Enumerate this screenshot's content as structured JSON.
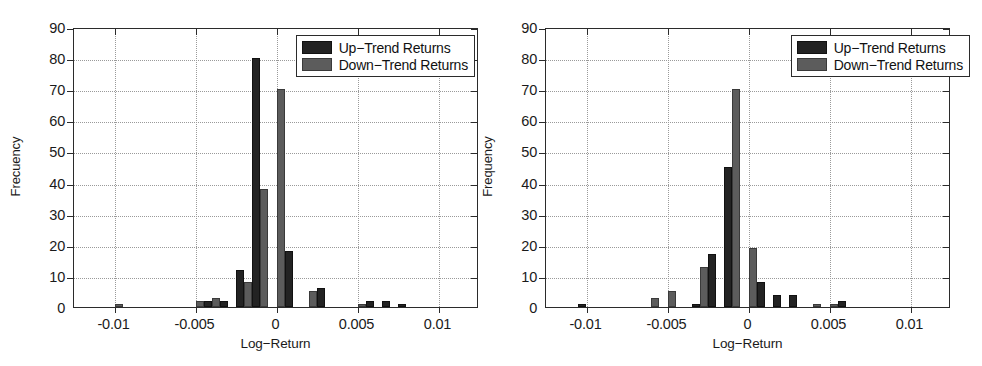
{
  "figure": {
    "panel_count": 2,
    "background": "#ffffff",
    "colors": {
      "up_trend": "#232323",
      "down_trend": "#5c5c5c",
      "axis": "#2b2b2b",
      "grid": "#9a9a9a"
    }
  },
  "chart_data": [
    {
      "type": "bar",
      "title": "",
      "xlabel": "Log−Return",
      "ylabel": "Frecuency",
      "xlim": [
        -0.0125,
        0.0125
      ],
      "ylim": [
        0,
        90
      ],
      "ytick_labels": [
        "0",
        "10",
        "20",
        "30",
        "40",
        "50",
        "60",
        "70",
        "80",
        "90"
      ],
      "ytick_values": [
        0,
        10,
        20,
        30,
        40,
        50,
        60,
        70,
        80,
        90
      ],
      "xtick_labels": [
        "-0.01",
        "-0.005",
        "0",
        "0.005",
        "0.01"
      ],
      "xtick_values": [
        -0.01,
        -0.005,
        0,
        0.005,
        0.01
      ],
      "grid": true,
      "legend_position": "top-right",
      "legend": [
        "Up−Trend Returns",
        "Down−Trend Returns"
      ],
      "bin_centers": [
        -0.01,
        -0.009,
        -0.008,
        -0.007,
        -0.006,
        -0.005,
        -0.004,
        -0.003,
        -0.002,
        -0.001,
        0.0,
        0.001,
        0.002,
        0.003,
        0.004,
        0.005,
        0.006,
        0.007,
        0.008,
        0.009
      ],
      "series": [
        {
          "name": "Up−Trend Returns",
          "color": "#232323",
          "values": [
            0,
            0,
            0,
            0,
            0,
            0,
            2,
            2,
            12,
            80,
            0,
            18,
            0,
            6,
            0,
            0,
            2,
            2,
            1,
            0
          ]
        },
        {
          "name": "Down−Trend Returns",
          "color": "#5c5c5c",
          "values": [
            1,
            0,
            0,
            0,
            0,
            2,
            3,
            0,
            8,
            38,
            70,
            0,
            5,
            0,
            0,
            1,
            0,
            0,
            0,
            0
          ]
        }
      ]
    },
    {
      "type": "bar",
      "title": "",
      "xlabel": "Log−Return",
      "ylabel": "Frequency",
      "xlim": [
        -0.0125,
        0.0125
      ],
      "ylim": [
        0,
        90
      ],
      "ytick_labels": [
        "0",
        "10",
        "20",
        "30",
        "40",
        "50",
        "60",
        "70",
        "80",
        "90"
      ],
      "ytick_values": [
        0,
        10,
        20,
        30,
        40,
        50,
        60,
        70,
        80,
        90
      ],
      "xtick_labels": [
        "-0.01",
        "-0.005",
        "0",
        "0.005",
        "0.01"
      ],
      "xtick_values": [
        -0.01,
        -0.005,
        0,
        0.005,
        0.01
      ],
      "grid": true,
      "legend_position": "top-right",
      "legend": [
        "Up−Trend Returns",
        "Down−Trend Returns"
      ],
      "bin_centers": [
        -0.01,
        -0.009,
        -0.008,
        -0.007,
        -0.006,
        -0.005,
        -0.004,
        -0.003,
        -0.002,
        -0.001,
        0.0,
        0.001,
        0.002,
        0.003,
        0.004,
        0.005,
        0.006,
        0.007,
        0.008,
        0.009
      ],
      "series": [
        {
          "name": "Up−Trend Returns",
          "color": "#232323",
          "values": [
            1,
            0,
            0,
            0,
            0,
            0,
            0,
            1,
            17,
            45,
            0,
            8,
            4,
            4,
            0,
            0,
            2,
            0,
            0,
            0
          ]
        },
        {
          "name": "Down−Trend Returns",
          "color": "#5c5c5c",
          "values": [
            0,
            0,
            0,
            0,
            3,
            5,
            0,
            13,
            0,
            70,
            19,
            0,
            0,
            0,
            1,
            1,
            0,
            0,
            0,
            0
          ]
        }
      ]
    }
  ]
}
